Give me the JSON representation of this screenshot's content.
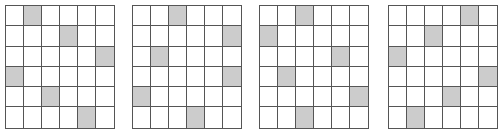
{
  "colors": {
    "shaded": "#cccccc",
    "empty": "#ffffff",
    "line": "#555555"
  },
  "grids": [
    {
      "left": 5,
      "rows": 6,
      "cols": 6,
      "shaded": [
        [
          0,
          1
        ],
        [
          1,
          3
        ],
        [
          2,
          5
        ],
        [
          3,
          0
        ],
        [
          4,
          2
        ],
        [
          5,
          4
        ]
      ]
    },
    {
      "left": 132,
      "rows": 6,
      "cols": 6,
      "shaded": [
        [
          0,
          2
        ],
        [
          1,
          5
        ],
        [
          2,
          1
        ],
        [
          3,
          5
        ],
        [
          4,
          0
        ],
        [
          5,
          3
        ]
      ]
    },
    {
      "left": 259,
      "rows": 6,
      "cols": 6,
      "shaded": [
        [
          0,
          2
        ],
        [
          1,
          0
        ],
        [
          2,
          4
        ],
        [
          3,
          1
        ],
        [
          4,
          5
        ],
        [
          5,
          2
        ]
      ]
    },
    {
      "left": 388,
      "rows": 6,
      "cols": 6,
      "shaded": [
        [
          0,
          4
        ],
        [
          1,
          2
        ],
        [
          2,
          0
        ],
        [
          3,
          5
        ],
        [
          4,
          3
        ],
        [
          5,
          1
        ]
      ]
    }
  ]
}
